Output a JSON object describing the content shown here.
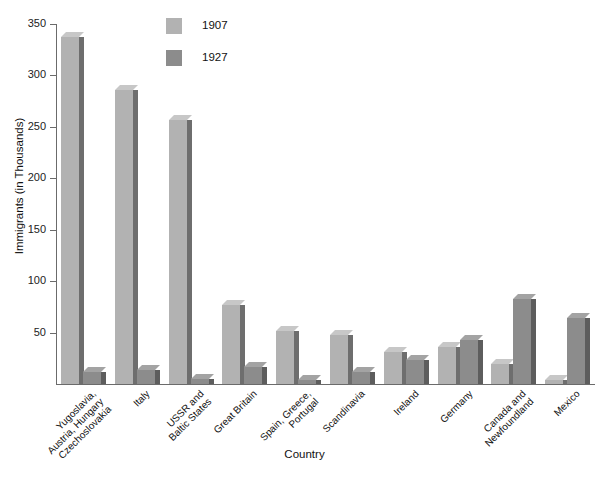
{
  "chart_data": {
    "type": "bar",
    "title": "",
    "xlabel": "Country",
    "ylabel": "Immigrants (in Thousands)",
    "ylim": [
      0,
      350
    ],
    "yticks": [
      0,
      50,
      100,
      150,
      200,
      250,
      300,
      350
    ],
    "ytick_labels": [
      "",
      "50",
      "100",
      "150",
      "200",
      "250",
      "300",
      "350"
    ],
    "grid": false,
    "legend_position": "top-center",
    "categories": [
      "Yugoslavia,\nAustria, Hungary\nCzechoslovakia",
      "Italy",
      "USSR and\nBaltic States",
      "Great Britain",
      "Spain, Greece,\nPortugal",
      "Scandinavia",
      "Ireland",
      "Germany",
      "Canada and\nNewfoundland",
      "Mexico"
    ],
    "series": [
      {
        "name": "1907",
        "color": "#b2b2b2",
        "values": [
          337,
          286,
          257,
          77,
          52,
          48,
          31,
          36,
          19,
          4
        ]
      },
      {
        "name": "1927",
        "color": "#8c8c8c",
        "values": [
          12,
          14,
          5,
          17,
          4,
          12,
          23,
          43,
          83,
          64
        ]
      }
    ]
  },
  "axes": {
    "y_title": "Immigrants (in Thousands)",
    "x_title": "Country"
  },
  "legend": {
    "items": [
      {
        "label": "1907",
        "color": "#b2b2b2"
      },
      {
        "label": "1927",
        "color": "#8c8c8c"
      }
    ]
  },
  "colors": {
    "series_1907": "#b2b2b2",
    "series_1927": "#8c8c8c",
    "axis": "#6b6b6b",
    "text": "#111111",
    "background": "#ffffff"
  }
}
